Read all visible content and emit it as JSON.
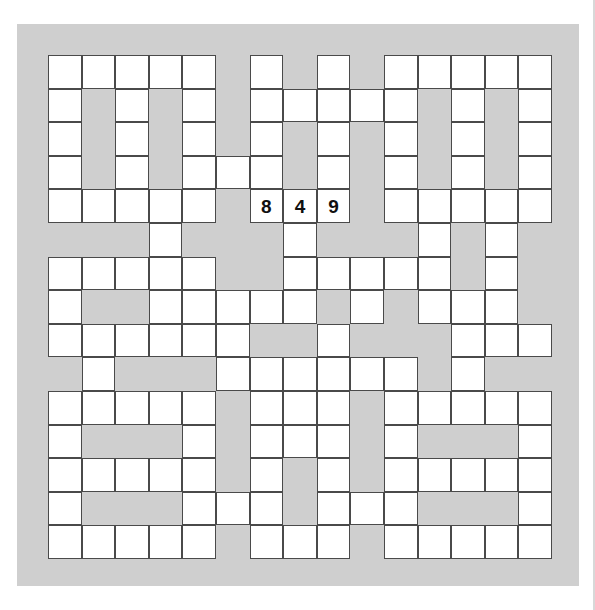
{
  "puzzle": {
    "type": "crossword-grid",
    "title": "Crossword Puzzle Grid",
    "rows": 15,
    "columns": 15,
    "cell_size_px": 33.6,
    "colors": {
      "page_background": "#ffffff",
      "panel_background": "#cfcfcf",
      "open_cell_fill": "#ffffff",
      "cell_border": "#4a4a4a",
      "entry_text": "#101010"
    },
    "legend": {
      "open": "white writable square",
      "block": "shaded blocked square"
    },
    "filled_entries": [
      {
        "row": 4,
        "col": 6,
        "value": "8"
      },
      {
        "row": 4,
        "col": 7,
        "value": "4"
      },
      {
        "row": 4,
        "col": 8,
        "value": "9"
      }
    ],
    "grid": [
      [
        "open",
        "open",
        "open",
        "open",
        "open",
        "block",
        "open",
        "block",
        "open",
        "block",
        "open",
        "open",
        "open",
        "open",
        "open"
      ],
      [
        "open",
        "block",
        "open",
        "block",
        "open",
        "block",
        "open",
        "open",
        "open",
        "open",
        "open",
        "block",
        "open",
        "block",
        "open"
      ],
      [
        "open",
        "block",
        "open",
        "block",
        "open",
        "block",
        "open",
        "block",
        "open",
        "block",
        "open",
        "block",
        "open",
        "block",
        "open"
      ],
      [
        "open",
        "block",
        "open",
        "block",
        "open",
        "open",
        "open",
        "block",
        "open",
        "block",
        "open",
        "block",
        "open",
        "block",
        "open"
      ],
      [
        "open",
        "open",
        "open",
        "open",
        "open",
        "block",
        "open",
        "open",
        "open",
        "block",
        "open",
        "open",
        "open",
        "open",
        "open"
      ],
      [
        "block",
        "block",
        "block",
        "open",
        "block",
        "block",
        "block",
        "open",
        "block",
        "block",
        "block",
        "open",
        "block",
        "open",
        "block"
      ],
      [
        "open",
        "open",
        "open",
        "open",
        "open",
        "block",
        "block",
        "open",
        "open",
        "open",
        "open",
        "open",
        "block",
        "open",
        "block"
      ],
      [
        "open",
        "block",
        "block",
        "open",
        "open",
        "open",
        "open",
        "open",
        "block",
        "open",
        "block",
        "open",
        "open",
        "open",
        "block"
      ],
      [
        "open",
        "open",
        "open",
        "open",
        "open",
        "open",
        "block",
        "block",
        "open",
        "block",
        "block",
        "block",
        "open",
        "open",
        "open"
      ],
      [
        "block",
        "open",
        "block",
        "block",
        "block",
        "open",
        "open",
        "open",
        "open",
        "open",
        "open",
        "block",
        "open",
        "block",
        "block"
      ],
      [
        "open",
        "open",
        "open",
        "open",
        "open",
        "block",
        "open",
        "open",
        "open",
        "block",
        "open",
        "open",
        "open",
        "open",
        "open"
      ],
      [
        "open",
        "block",
        "block",
        "block",
        "open",
        "block",
        "open",
        "open",
        "open",
        "block",
        "open",
        "block",
        "block",
        "block",
        "open"
      ],
      [
        "open",
        "open",
        "open",
        "open",
        "open",
        "block",
        "open",
        "block",
        "open",
        "block",
        "open",
        "open",
        "open",
        "open",
        "open"
      ],
      [
        "open",
        "block",
        "block",
        "block",
        "open",
        "open",
        "open",
        "block",
        "open",
        "open",
        "open",
        "block",
        "block",
        "block",
        "open"
      ],
      [
        "open",
        "open",
        "open",
        "open",
        "open",
        "block",
        "open",
        "open",
        "open",
        "block",
        "open",
        "open",
        "open",
        "open",
        "open"
      ]
    ]
  }
}
